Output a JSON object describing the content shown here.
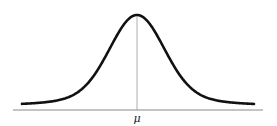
{
  "diagram": {
    "type": "normal-distribution-curve",
    "mean_label": "μ",
    "colors": {
      "curve": "#111111",
      "axis": "#888888",
      "mean_line": "#999999",
      "background": "#ffffff"
    }
  }
}
